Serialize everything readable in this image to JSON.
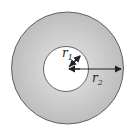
{
  "diagram": {
    "type": "annulus",
    "colors": {
      "ring_fill": "#c8c8c8",
      "stroke": "#333333",
      "background": "#ffffff"
    },
    "outer_circle": {
      "cx": 67.5,
      "cy": 68,
      "r": 56
    },
    "inner_circle": {
      "cx": 66,
      "cy": 69,
      "r": 22.5
    },
    "labels": {
      "r1": {
        "base": "r",
        "sub": "1"
      },
      "r2": {
        "base": "r",
        "sub": "2"
      }
    }
  }
}
